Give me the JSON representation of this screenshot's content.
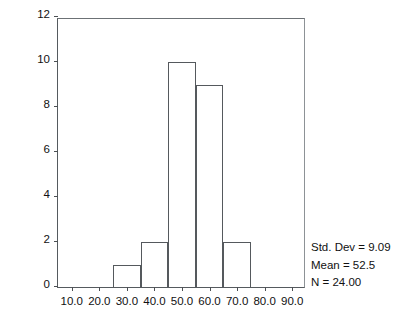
{
  "chart_data": {
    "type": "bar",
    "title": "",
    "xlabel": "",
    "ylabel": "Number of Cases",
    "categories": [
      "25-35",
      "35-45",
      "45-55",
      "55-65",
      "65-75"
    ],
    "values": [
      1,
      2,
      10,
      9,
      2
    ],
    "bin_width": 10,
    "bin_starts": [
      25,
      35,
      45,
      55,
      65
    ],
    "xlim": [
      5,
      95
    ],
    "ylim": [
      0,
      12
    ],
    "x_ticks": [
      "10.0",
      "20.0",
      "30.0",
      "40.0",
      "50.0",
      "60.0",
      "70.0",
      "80.0",
      "90.0"
    ],
    "x_tick_values": [
      10,
      20,
      30,
      40,
      50,
      60,
      70,
      80,
      90
    ],
    "y_ticks": [
      "0",
      "2",
      "4",
      "6",
      "8",
      "10",
      "12"
    ],
    "y_tick_values": [
      0,
      2,
      4,
      6,
      8,
      10,
      12
    ],
    "grid": false,
    "legend": "none",
    "bar_fill_color": "#ffffff",
    "bar_edge_color": "#55595d",
    "background_color": "#ffffff",
    "annotations": [
      "Std. Dev = 9.09",
      "Mean = 52.5",
      "N = 24.00"
    ]
  },
  "stats": {
    "std_dev": "Std. Dev = 9.09",
    "mean": "Mean = 52.5",
    "n": "N = 24.00"
  }
}
